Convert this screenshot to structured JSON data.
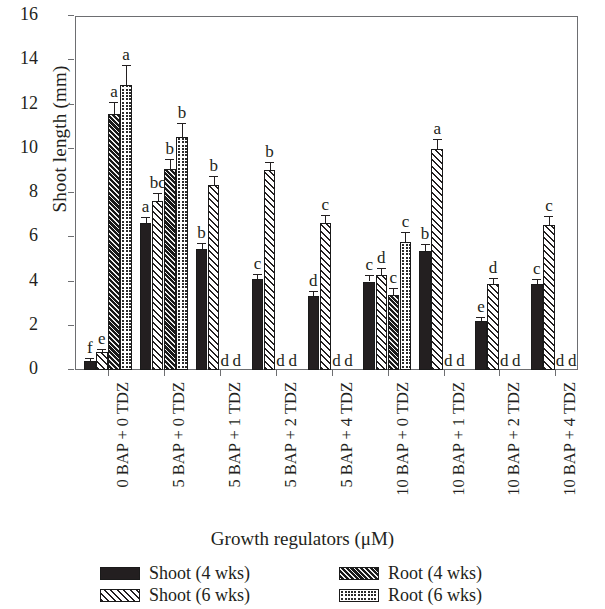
{
  "chart_data": {
    "type": "bar",
    "title": "",
    "xlabel": "Growth regulators (μM)",
    "ylabel": "Shoot length (mm)",
    "ylim": [
      0,
      16
    ],
    "yticks": [
      0,
      2,
      4,
      6,
      8,
      10,
      12,
      14,
      16
    ],
    "ytick_labels": [
      "0",
      "2",
      "4",
      "6",
      "8",
      "10",
      "12",
      "14",
      "16"
    ],
    "grid": false,
    "legend_position": "below-plot",
    "categories": [
      "0 BAP + 0 TDZ",
      "5 BAP + 0 TDZ",
      "5 BAP + 1 TDZ",
      "5 BAP + 2 TDZ",
      "5 BAP + 4 TDZ",
      "10 BAP + 0 TDZ",
      "10 BAP + 1 TDZ",
      "10 BAP + 2 TDZ",
      "10 BAP + 4 TDZ"
    ],
    "series": [
      {
        "name": "Shoot (4 wks)",
        "pattern": "solid-black",
        "values": [
          0.4,
          6.65,
          5.45,
          4.1,
          3.35,
          4.0,
          5.4,
          2.2,
          3.9
        ],
        "errors": [
          0.12,
          0.25,
          0.3,
          0.25,
          0.2,
          0.3,
          0.3,
          0.2,
          0.22
        ],
        "labels": [
          "f",
          "a",
          "b",
          "c",
          "d",
          "c",
          "b",
          "e",
          "c"
        ]
      },
      {
        "name": "Shoot (6 wks)",
        "pattern": "diagonal-hatch",
        "values": [
          0.8,
          7.65,
          8.35,
          9.05,
          6.65,
          4.3,
          10.0,
          3.9,
          6.55
        ],
        "errors": [
          0.15,
          0.35,
          0.4,
          0.35,
          0.35,
          0.3,
          0.45,
          0.25,
          0.4
        ],
        "labels": [
          "e",
          "bc",
          "b",
          "b",
          "c",
          "d",
          "a",
          "d",
          "c"
        ]
      },
      {
        "name": "Root (4 wks)",
        "pattern": "dense-diagonal-hatch",
        "values": [
          11.55,
          9.1,
          0.0,
          0.0,
          0.0,
          3.4,
          0.0,
          0.0,
          0.0
        ],
        "errors": [
          0.55,
          0.45,
          0.0,
          0.0,
          0.0,
          0.3,
          0.0,
          0.0,
          0.0
        ],
        "labels": [
          "a",
          "b",
          "d",
          "d",
          "d",
          "c",
          "d",
          "d",
          "d"
        ]
      },
      {
        "name": "Root (6 wks)",
        "pattern": "dotted-checker",
        "values": [
          12.9,
          10.55,
          0.0,
          0.0,
          0.0,
          5.8,
          0.0,
          0.0,
          0.0
        ],
        "errors": [
          0.9,
          0.6,
          0.0,
          0.0,
          0.0,
          0.45,
          0.0,
          0.0,
          0.0
        ],
        "labels": [
          "a",
          "b",
          "d",
          "d",
          "d",
          "c",
          "d",
          "d",
          "d"
        ]
      }
    ]
  },
  "legend": {
    "items": [
      {
        "label": "Shoot (4 wks)",
        "pattern": "solid-black"
      },
      {
        "label": "Root (4 wks)",
        "pattern": "dense-diagonal-hatch"
      },
      {
        "label": "Shoot (6 wks)",
        "pattern": "diagonal-hatch"
      },
      {
        "label": "Root (6 wks)",
        "pattern": "dotted-checker"
      }
    ]
  },
  "colors": {
    "ink": "#231f20",
    "axis": "#6d6e71",
    "background": "#ffffff"
  }
}
